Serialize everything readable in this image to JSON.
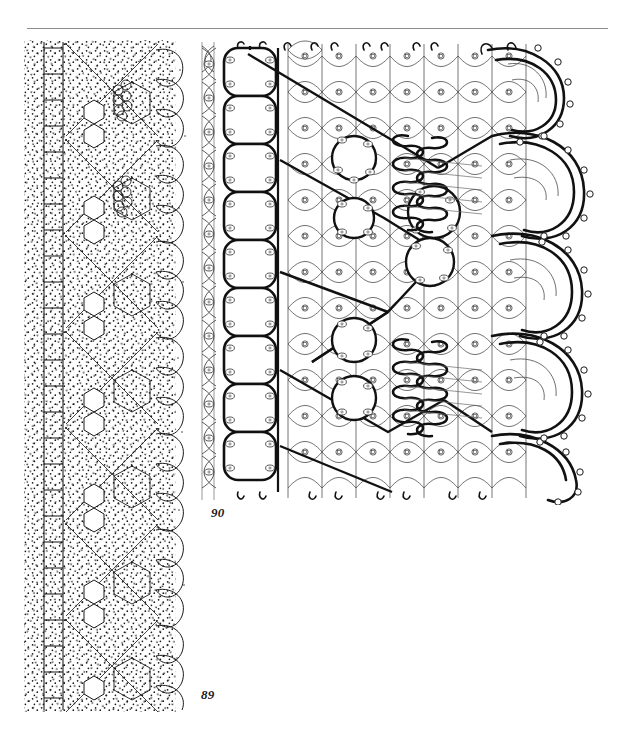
{
  "page": {
    "background_color": "#ffffff",
    "width": 634,
    "height": 745,
    "ink_color": "#1a1a1a",
    "rule_color": "#8c8c8c",
    "document_type": "bobbin-lace-pattern-plate"
  },
  "header": {
    "rule_name": "header-rule",
    "rule_left": 27,
    "rule_top": 28,
    "rule_width": 581
  },
  "figures": [
    {
      "id": "fig-89",
      "caption": "89",
      "kind": "pricking-diagram",
      "description": "stippled pricking pattern with footside ladder, hexagonal net ground, scalloped headside and dense tally clusters",
      "caption_x": 201,
      "caption_y": 687,
      "bounds": {
        "left": 22,
        "top": 40,
        "width": 170,
        "height": 668
      }
    },
    {
      "id": "fig-90",
      "caption": "90",
      "kind": "working-diagram",
      "description": "thread-path working diagram with footside braid column, square net ground, bold diamond outline, serpentine zigzag braids and picot scalloped headside",
      "caption_x": 211,
      "caption_y": 505,
      "bounds": {
        "left": 192,
        "top": 40,
        "width": 404,
        "height": 462
      }
    }
  ],
  "pricking": {
    "ladder_rungs": 26,
    "repeats": 7,
    "ground_rows": 21,
    "stipple_density": "dense",
    "tally_clusters": 4
  },
  "working": {
    "footside_pairs": 12,
    "net_columns": 9,
    "net_rows": 13,
    "scallops": 5,
    "zigzag_braids": 2,
    "picots_per_scallop": 7
  }
}
